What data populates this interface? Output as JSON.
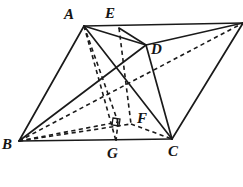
{
  "figure": {
    "background_color": "#ffffff",
    "stroke_color": "#1a1a1a",
    "canvas": {
      "width": 243,
      "height": 187
    }
  },
  "labels": {
    "A": {
      "text": "A",
      "x": 64,
      "y": 7
    },
    "E": {
      "text": "E",
      "x": 105,
      "y": 6
    },
    "D": {
      "text": "D",
      "x": 151,
      "y": 42
    },
    "F": {
      "text": "F",
      "x": 137,
      "y": 111
    },
    "B": {
      "text": "B",
      "x": 2,
      "y": 137
    },
    "G": {
      "text": "G",
      "x": 107,
      "y": 146
    },
    "C": {
      "text": "C",
      "x": 168,
      "y": 144
    }
  },
  "points": {
    "A": {
      "x": 84,
      "y": 26
    },
    "E": {
      "x": 119,
      "y": 28
    },
    "T": {
      "x": 243,
      "y": 23
    },
    "D": {
      "x": 146,
      "y": 45
    },
    "F": {
      "x": 131,
      "y": 124
    },
    "G": {
      "x": 116,
      "y": 141
    },
    "H": {
      "x": 118,
      "y": 122
    },
    "B": {
      "x": 19,
      "y": 141
    },
    "C": {
      "x": 172,
      "y": 139
    }
  },
  "edges_solid": [
    {
      "name": "A-T-top-edge",
      "from": "A",
      "to": "T"
    },
    {
      "name": "A-B",
      "from": "A",
      "to": "B"
    },
    {
      "name": "A-D",
      "from": "A",
      "to": "D"
    },
    {
      "name": "A-C",
      "from": "A",
      "to": "C"
    },
    {
      "name": "E-D",
      "from": "E",
      "to": "D"
    },
    {
      "name": "D-T",
      "from": "D",
      "to": "T"
    },
    {
      "name": "D-C",
      "from": "D",
      "to": "C"
    },
    {
      "name": "T-C",
      "from": "T",
      "to": "C"
    },
    {
      "name": "B-C-base",
      "from": "B",
      "to": "C"
    },
    {
      "name": "B-D",
      "from": "B",
      "to": "D"
    }
  ],
  "edges_dashed": [
    {
      "name": "A-G-hidden",
      "from": "A",
      "to": "G"
    },
    {
      "name": "A-H-hidden",
      "from": "A",
      "to": "H"
    },
    {
      "name": "E-F-hidden",
      "from": "E",
      "to": "F"
    },
    {
      "name": "B-F-hidden",
      "from": "B",
      "to": "F"
    },
    {
      "name": "B-H-hidden",
      "from": "B",
      "to": "H"
    },
    {
      "name": "B-T-hidden",
      "from": "B",
      "to": "T"
    },
    {
      "name": "F-C-hidden",
      "from": "F",
      "to": "C"
    },
    {
      "name": "H-G-hidden",
      "from": "H",
      "to": "G"
    }
  ],
  "markers": {
    "right_angle": {
      "name": "right-angle-mark",
      "x": 114,
      "y": 119,
      "size": 7
    }
  }
}
